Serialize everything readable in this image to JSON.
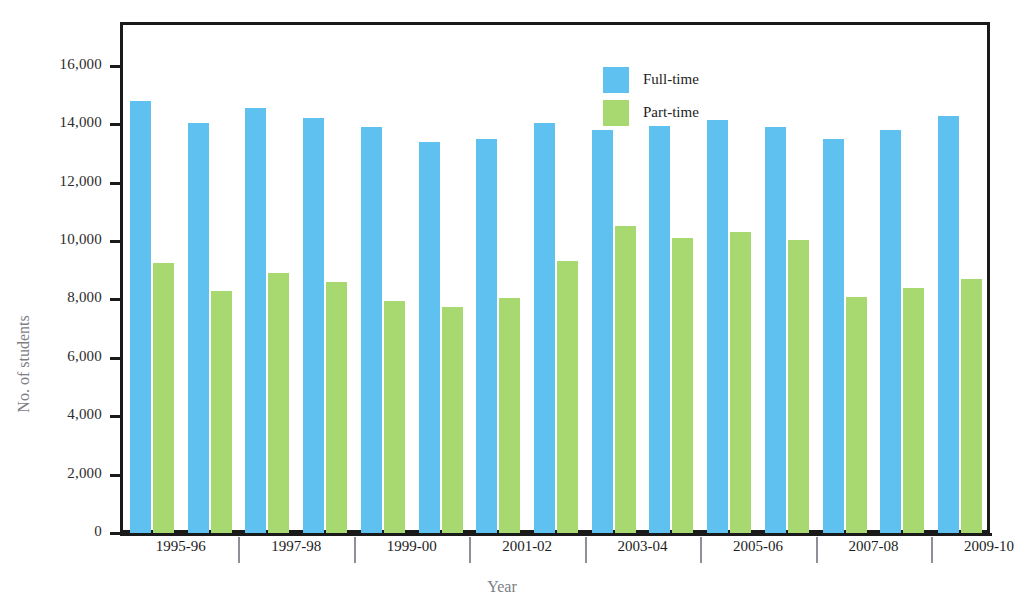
{
  "chart_data": {
    "type": "bar",
    "title": "",
    "xlabel": "Year",
    "ylabel": "No. of students",
    "ylim": [
      0,
      17400
    ],
    "y_ticks": [
      0,
      2000,
      4000,
      6000,
      8000,
      10000,
      12000,
      14000,
      16000
    ],
    "y_tick_labels": [
      "0",
      "2,000",
      "4,000",
      "6,000",
      "8,000",
      "10,000",
      "12,000",
      "14,000",
      "16,000"
    ],
    "grid": false,
    "legend_position": "top-center-right",
    "categories": [
      "1995-96",
      "1996-97",
      "1997-98",
      "1998-99",
      "1999-00",
      "2000-01",
      "2001-02",
      "2002-03",
      "2003-04",
      "2004-05",
      "2005-06",
      "2006-07",
      "2007-08",
      "2008-09",
      "2009-10"
    ],
    "x_tick_labels": [
      "1995-96",
      "1997-98",
      "1999-00",
      "2001-02",
      "2003-04",
      "2005-06",
      "2007-08",
      "2009-10"
    ],
    "series": [
      {
        "name": "Full-time",
        "color": "#5fc1ef",
        "values": [
          14800,
          14050,
          14550,
          14200,
          13900,
          13400,
          13500,
          14050,
          13800,
          13950,
          14150,
          13900,
          13500,
          13800,
          14300
        ]
      },
      {
        "name": "Part-time",
        "color": "#a8d870",
        "values": [
          9250,
          8300,
          8900,
          8600,
          7950,
          7750,
          8050,
          9300,
          10500,
          10100,
          10300,
          10050,
          8100,
          8400,
          8700
        ]
      }
    ]
  },
  "legend": {
    "items": [
      {
        "label": "Full-time",
        "color": "#5fc1ef"
      },
      {
        "label": "Part-time",
        "color": "#a8d870"
      }
    ]
  },
  "axes": {
    "y_title": "No. of students",
    "x_title": "Year"
  }
}
